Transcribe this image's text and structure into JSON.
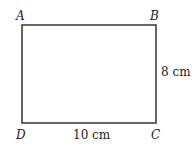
{
  "diagram": {
    "type": "rectangle",
    "vertices": {
      "top_left": "A",
      "top_right": "B",
      "bottom_right": "C",
      "bottom_left": "D"
    },
    "dimensions": {
      "width_label": "10 cm",
      "height_label": "8 cm"
    },
    "line_color": "#333333"
  }
}
